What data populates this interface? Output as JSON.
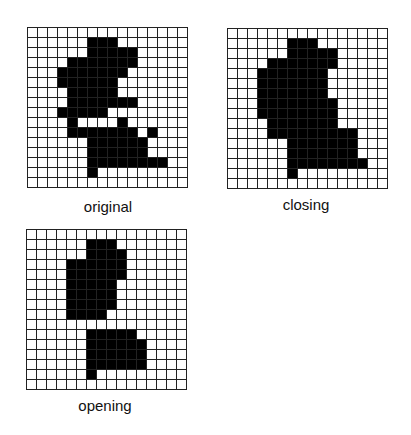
{
  "panels": [
    {
      "id": "original",
      "label": "original",
      "grid_left": 27,
      "grid_top": 27,
      "label_left": 28,
      "label_top": 198,
      "rows": 16,
      "cols": 16,
      "filled": [
        [],
        [
          6,
          7,
          8
        ],
        [
          6,
          7,
          8,
          9,
          10
        ],
        [
          4,
          5,
          6,
          7,
          8,
          9,
          10
        ],
        [
          3,
          4,
          5,
          6,
          7,
          8,
          9
        ],
        [
          3,
          4,
          5,
          6,
          7,
          8
        ],
        [
          4,
          5,
          6,
          7,
          8
        ],
        [
          4,
          5,
          6,
          7,
          8,
          9,
          10
        ],
        [
          3,
          4,
          5,
          6,
          7
        ],
        [
          4,
          9
        ],
        [
          4,
          5,
          6,
          7,
          8,
          9,
          10,
          12
        ],
        [
          6,
          7,
          8,
          9,
          10,
          11
        ],
        [
          6,
          7,
          8,
          9,
          10,
          11
        ],
        [
          6,
          7,
          8,
          9,
          10,
          11,
          12,
          13
        ],
        [
          6
        ],
        []
      ]
    },
    {
      "id": "closing",
      "label": "closing",
      "grid_left": 227,
      "grid_top": 28,
      "label_left": 226,
      "label_top": 196,
      "rows": 16,
      "cols": 16,
      "filled": [
        [],
        [
          6,
          7,
          8
        ],
        [
          6,
          7,
          8,
          9,
          10
        ],
        [
          4,
          5,
          6,
          7,
          8,
          9,
          10
        ],
        [
          3,
          4,
          5,
          6,
          7,
          8,
          9
        ],
        [
          3,
          4,
          5,
          6,
          7,
          8,
          9
        ],
        [
          3,
          4,
          5,
          6,
          7,
          8,
          9
        ],
        [
          3,
          4,
          5,
          6,
          7,
          8,
          9,
          10
        ],
        [
          3,
          4,
          5,
          6,
          7,
          8,
          9,
          10
        ],
        [
          4,
          5,
          6,
          7,
          8,
          9,
          10
        ],
        [
          4,
          5,
          6,
          7,
          8,
          9,
          10,
          11,
          12
        ],
        [
          6,
          7,
          8,
          9,
          10,
          11,
          12
        ],
        [
          6,
          7,
          8,
          9,
          10,
          11,
          12
        ],
        [
          6,
          7,
          8,
          9,
          10,
          11,
          12,
          13
        ],
        [
          6
        ],
        []
      ]
    },
    {
      "id": "opening",
      "label": "opening",
      "grid_left": 26,
      "grid_top": 229,
      "label_left": 25,
      "label_top": 397,
      "rows": 16,
      "cols": 16,
      "filled": [
        [],
        [
          6,
          7,
          8
        ],
        [
          6,
          7,
          8,
          9
        ],
        [
          4,
          5,
          6,
          7,
          8,
          9
        ],
        [
          4,
          5,
          6,
          7,
          8,
          9
        ],
        [
          4,
          5,
          6,
          7,
          8
        ],
        [
          4,
          5,
          6,
          7,
          8
        ],
        [
          4,
          5,
          6,
          7,
          8
        ],
        [
          4,
          5,
          6,
          7
        ],
        [],
        [
          6,
          7,
          8,
          9,
          10
        ],
        [
          6,
          7,
          8,
          9,
          10,
          11
        ],
        [
          6,
          7,
          8,
          9,
          10,
          11
        ],
        [
          6,
          7,
          8,
          9,
          10,
          11
        ],
        [
          6
        ],
        []
      ]
    }
  ],
  "colors": {
    "filled": "#000000",
    "empty": "#ffffff",
    "grid_line": "#222222"
  }
}
